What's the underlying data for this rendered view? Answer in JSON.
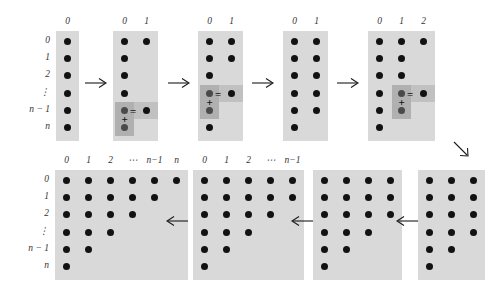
{
  "figure": {
    "type": "diagram",
    "background_color": "#ffffff",
    "panel_color": "#d9d9d9",
    "dot_color": "#121212",
    "highlight_color": "#8c8c8c"
  },
  "labels": {
    "row_labels": [
      "0",
      "1",
      "2",
      "⋮",
      "n − 1",
      "n"
    ],
    "col_labels_1": [
      "0"
    ],
    "col_labels_2": [
      "0",
      "1"
    ],
    "col_labels_3": [
      "0",
      "1",
      "2"
    ],
    "col_labels_full": [
      "0",
      "1",
      "2",
      "⋯",
      "n−1",
      "n"
    ],
    "col_labels_nm1": [
      "0",
      "1",
      "2",
      "⋯",
      "n−1"
    ],
    "plus_sign": "+",
    "equals_sign": "="
  },
  "arrows": {
    "right": "→",
    "left": "←",
    "down_right": "↘"
  },
  "panels": [
    {
      "id": "panel-1",
      "name": "single-column-start",
      "col_headers": [
        "0"
      ],
      "show_row_labels": true,
      "columns": [
        6
      ],
      "highlight": null
    },
    {
      "id": "panel-2",
      "name": "first-sum-bottom",
      "col_headers": [
        "0",
        "1"
      ],
      "show_row_labels": false,
      "columns": [
        6,
        1
      ],
      "highlight": {
        "col": 0,
        "rows": [
          4,
          5
        ],
        "result_col": 1,
        "result_row": 4
      }
    },
    {
      "id": "panel-3",
      "name": "second-sum",
      "col_headers": [
        "0",
        "1"
      ],
      "show_row_labels": false,
      "columns": [
        6,
        2
      ],
      "highlight": {
        "col": 0,
        "rows": [
          3,
          4
        ],
        "result_col": 1,
        "result_row": 3
      }
    },
    {
      "id": "panel-4",
      "name": "two-columns-complete",
      "col_headers": [
        "0",
        "1"
      ],
      "show_row_labels": false,
      "columns": [
        6,
        5
      ],
      "highlight": null
    },
    {
      "id": "panel-5",
      "name": "third-column-begin",
      "col_headers": [
        "0",
        "1",
        "2"
      ],
      "show_row_labels": false,
      "columns": [
        6,
        5,
        1
      ],
      "highlight": {
        "col": 1,
        "rows": [
          3,
          4
        ],
        "result_col": 2,
        "result_row": 3
      }
    },
    {
      "id": "panel-6",
      "name": "three-columns",
      "col_headers": [],
      "show_row_labels": false,
      "columns": [
        6,
        5,
        4
      ],
      "highlight": null
    },
    {
      "id": "panel-7",
      "name": "four-columns",
      "col_headers": [],
      "show_row_labels": false,
      "columns": [
        6,
        5,
        4,
        3
      ],
      "highlight": null
    },
    {
      "id": "panel-8",
      "name": "n-minus-one-columns",
      "col_headers": [
        "0",
        "1",
        "2",
        "⋯",
        "n−1"
      ],
      "show_row_labels": false,
      "columns": [
        6,
        5,
        4,
        3,
        2
      ],
      "highlight": null
    },
    {
      "id": "panel-9",
      "name": "triangular-array-final",
      "col_headers": [
        "0",
        "1",
        "2",
        "⋯",
        "n−1",
        "n"
      ],
      "show_row_labels": true,
      "columns": [
        6,
        5,
        4,
        3,
        2,
        1
      ],
      "highlight": null
    }
  ]
}
